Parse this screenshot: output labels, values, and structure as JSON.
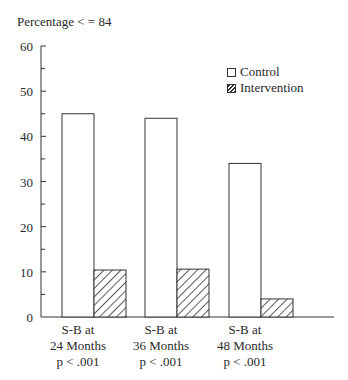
{
  "chart_data": {
    "type": "bar",
    "title": "",
    "ylabel": "Percentage < = 84",
    "xlabel": "",
    "ylim": [
      0,
      60
    ],
    "yticks": [
      0,
      10,
      20,
      30,
      40,
      50,
      60
    ],
    "yminor_ticks": [
      5,
      15,
      25,
      35,
      45,
      55
    ],
    "grid": false,
    "legend_position": "upper right",
    "categories": [
      "S-B at 24 Months p < .001",
      "S-B at 36 Months p < .001",
      "S-B at 48 Months p < .001"
    ],
    "category_lines": [
      [
        "S-B at",
        "24 Months",
        "p < .001"
      ],
      [
        "S-B at",
        "36 Months",
        "p < .001"
      ],
      [
        "S-B at",
        "48 Months",
        "p < .001"
      ]
    ],
    "series": [
      {
        "name": "Control",
        "fill": "white",
        "values": [
          45,
          44,
          34
        ]
      },
      {
        "name": "Intervention",
        "fill": "hatched",
        "values": [
          10.4,
          10.6,
          4
        ]
      }
    ]
  },
  "ylabel_text": "Percentage < = 84",
  "legend": {
    "control": "Control",
    "intervention": "Intervention"
  },
  "xlabels": [
    {
      "line1": "S-B at",
      "line2": "24 Months",
      "line3": "p < .001"
    },
    {
      "line1": "S-B at",
      "line2": "36 Months",
      "line3": "p < .001"
    },
    {
      "line1": "S-B at",
      "line2": "48 Months",
      "line3": "p < .001"
    }
  ],
  "colors": {
    "stroke": "#333333",
    "background": "#ffffff"
  }
}
